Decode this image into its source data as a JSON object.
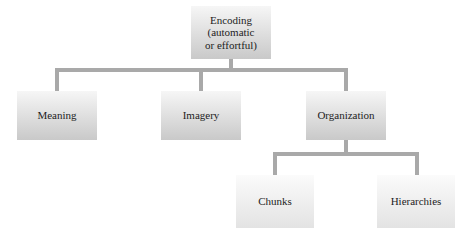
{
  "diagram": {
    "type": "hierarchy",
    "root": {
      "label": "Encoding\n(automatic\nor effortful)"
    },
    "level1": [
      {
        "label": "Meaning"
      },
      {
        "label": "Imagery"
      },
      {
        "label": "Organization"
      }
    ],
    "level2": [
      {
        "label": "Chunks",
        "parent": "Organization"
      },
      {
        "label": "Hierarchies",
        "parent": "Organization"
      }
    ]
  },
  "colors": {
    "connector": "#a9a9a9",
    "box_top": "#f6f6f6",
    "box_bottom": "#c9c9c9",
    "text": "#1d1d1d"
  }
}
